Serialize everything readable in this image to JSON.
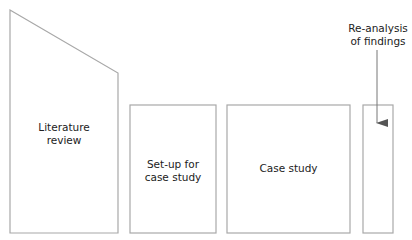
{
  "diagram": {
    "colors": {
      "stroke": "#a8a8a8",
      "text": "#222222",
      "arrow": "#555555",
      "background": "#ffffff"
    },
    "stages": [
      {
        "id": "literature-review",
        "label_line1": "Literature",
        "label_line2": "review"
      },
      {
        "id": "setup",
        "label_line1": "Set-up for",
        "label_line2": "case study"
      },
      {
        "id": "case-study",
        "label_line1": "Case study"
      },
      {
        "id": "reanalysis",
        "label_line1": "Re-analysis",
        "label_line2": "of findings"
      }
    ]
  }
}
